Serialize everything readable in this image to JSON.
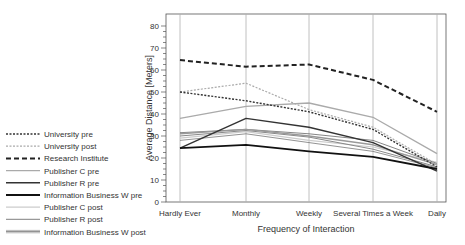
{
  "chart_data": {
    "type": "line",
    "title": "",
    "xlabel": "Frequency of Interaction",
    "ylabel": "Average Distance [Meters]",
    "ylim": [
      0,
      80
    ],
    "yticks": [
      0,
      10,
      20,
      30,
      40,
      50,
      60,
      70,
      80
    ],
    "categories": [
      "Hardly Ever",
      "Monthly",
      "Weekly",
      "Several Times a Week",
      "Daily"
    ],
    "grid": "vertical lines at categories",
    "legend_position": "left",
    "series": [
      {
        "name": "University pre",
        "values": [
          50,
          46,
          41,
          33,
          16
        ],
        "color": "#333333",
        "dash": "2,1.5",
        "width": 1.4
      },
      {
        "name": "University post",
        "values": [
          50,
          54,
          42,
          34,
          17
        ],
        "color": "#aaaaaa",
        "dash": "2,1.5",
        "width": 1.2
      },
      {
        "name": "Research Institute",
        "values": [
          64.5,
          61.5,
          62.5,
          55.5,
          41
        ],
        "color": "#222222",
        "dash": "5,3",
        "width": 2
      },
      {
        "name": "Publisher C pre",
        "values": [
          38,
          43.5,
          45,
          38.5,
          22
        ],
        "color": "#aaaaaa",
        "dash": "",
        "width": 1.3
      },
      {
        "name": "Publisher R pre",
        "values": [
          24.5,
          38,
          34,
          27,
          14
        ],
        "color": "#333333",
        "dash": "",
        "width": 1.4
      },
      {
        "name": "Information Business W pre",
        "values": [
          24.5,
          26,
          23,
          20.5,
          15
        ],
        "color": "#111111",
        "dash": "",
        "width": 1.8
      },
      {
        "name": "Publisher C post",
        "values": [
          29,
          32,
          28,
          25,
          18
        ],
        "color": "#cccccc",
        "dash": "",
        "width": 1.2
      },
      {
        "name": "Publisher R post",
        "values": [
          31,
          33,
          30,
          26,
          17
        ],
        "color": "#999999",
        "dash": "",
        "width": 1.4
      },
      {
        "name": "Information Business W post",
        "values": [
          30,
          32.5,
          29.5,
          24,
          16
        ],
        "color": "#888888",
        "dash": "",
        "width": 1
      },
      {
        "name": "extra-1",
        "values": [
          28,
          31,
          27,
          23,
          15.5
        ],
        "color": "#777777",
        "dash": "",
        "width": 0.8
      },
      {
        "name": "extra-2",
        "values": [
          31.5,
          33,
          31,
          28,
          17.5
        ],
        "color": "#666666",
        "dash": "",
        "width": 0.8
      }
    ]
  },
  "legend": {
    "items": [
      {
        "label": "University pre",
        "series": 0
      },
      {
        "label": "University post",
        "series": 1
      },
      {
        "label": "Research Institute",
        "series": 2
      },
      {
        "label": "Publisher C pre",
        "series": 3
      },
      {
        "label": "Publisher R pre",
        "series": 4
      },
      {
        "label": "Information Business W pre",
        "series": 5
      },
      {
        "label": "Publisher C post",
        "series": 6
      },
      {
        "label": "Publisher R post",
        "series": 7
      },
      {
        "label": "Information Business W post",
        "series": 8
      }
    ]
  }
}
